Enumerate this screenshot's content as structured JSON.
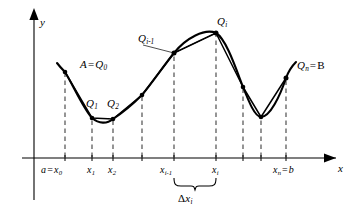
{
  "figure": {
    "background_color": "#ffffff",
    "ink_color": "#000000",
    "dash_color": "#4a4a4a"
  },
  "axes": {
    "y_label": "y",
    "x_label": "x",
    "x_axis_y": 158,
    "y_axis_x": 34,
    "has_arrows": true
  },
  "x_tick_labels": [
    {
      "id": "x0",
      "text_a": "a",
      "eq": "=",
      "text_x": "x",
      "sub": "0",
      "px": 65
    },
    {
      "id": "x1",
      "text_x": "x",
      "sub": "1",
      "px": 92
    },
    {
      "id": "x2",
      "text_x": "x",
      "sub": "2",
      "px": 113
    },
    {
      "id": "xi-1",
      "text_x": "x",
      "sub": "i-1",
      "px": 174
    },
    {
      "id": "xi",
      "text_x": "x",
      "sub": "i",
      "px": 216
    },
    {
      "id": "xn",
      "text_x": "x",
      "sub": "n",
      "eq": "=",
      "text_b": "b",
      "px": 286
    }
  ],
  "dashed_gridlines_px": [
    65,
    92,
    113,
    142,
    174,
    216,
    243,
    261,
    286
  ],
  "point_labels": [
    {
      "id": "A-Q0",
      "lead": "A",
      "eq": "=",
      "sym": "Q",
      "sub": "0",
      "x": 80,
      "y": 59
    },
    {
      "id": "Q1",
      "sym": "Q",
      "sub": "1",
      "x": 86,
      "y": 98
    },
    {
      "id": "Q2",
      "sym": "Q",
      "sub": "2",
      "x": 107,
      "y": 98
    },
    {
      "id": "Qi-1",
      "sym": "Q",
      "sub": "i-1",
      "x": 144,
      "y": 36
    },
    {
      "id": "Qi",
      "sym": "Q",
      "sub": "i",
      "x": 217,
      "y": 18
    },
    {
      "id": "Qn-B",
      "sym": "Q",
      "sub": "n",
      "eq": "=",
      "trail": "B",
      "x": 307,
      "y": 61
    }
  ],
  "delta_label": {
    "delta": "Δ",
    "sym": "x",
    "sub": "i",
    "x": 178,
    "y": 198
  },
  "brace": {
    "left_px": 174,
    "right_px": 216,
    "top_px": 180,
    "label_gap": 6
  },
  "curve_points": [
    {
      "x": 57,
      "y": 63
    },
    {
      "x": 65,
      "y": 72
    },
    {
      "x": 92,
      "y": 118
    },
    {
      "x": 113,
      "y": 119
    },
    {
      "x": 142,
      "y": 95
    },
    {
      "x": 174,
      "y": 53
    },
    {
      "x": 216,
      "y": 33
    },
    {
      "x": 243,
      "y": 87
    },
    {
      "x": 261,
      "y": 117
    },
    {
      "x": 286,
      "y": 78
    },
    {
      "x": 296,
      "y": 62
    }
  ],
  "vertex_points": [
    {
      "id": "Q0",
      "x": 65,
      "y": 72
    },
    {
      "id": "Q1",
      "x": 92,
      "y": 118
    },
    {
      "id": "Q2",
      "x": 113,
      "y": 119
    },
    {
      "id": "Q3",
      "x": 142,
      "y": 95
    },
    {
      "id": "Qi-1",
      "x": 174,
      "y": 53
    },
    {
      "id": "Qi",
      "x": 216,
      "y": 33
    },
    {
      "id": "Qi+1",
      "x": 243,
      "y": 87
    },
    {
      "id": "Qi+2",
      "x": 261,
      "y": 117
    },
    {
      "id": "Qn",
      "x": 286,
      "y": 78
    }
  ]
}
